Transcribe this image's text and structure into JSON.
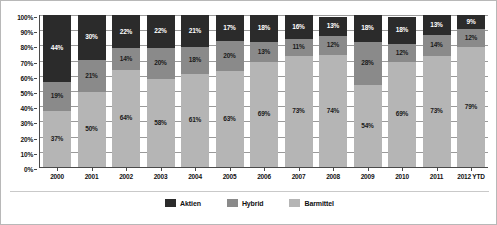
{
  "chart_data": {
    "type": "bar",
    "variant": "stacked-100-percent",
    "title": "",
    "xlabel": "",
    "ylabel": "",
    "ylim": [
      0,
      100
    ],
    "ytick_labels": [
      "100%",
      "90%",
      "80%",
      "70%",
      "60%",
      "50%",
      "40%",
      "30%",
      "20%",
      "10%",
      "0%"
    ],
    "ytick_values": [
      100,
      90,
      80,
      70,
      60,
      50,
      40,
      30,
      20,
      10,
      0
    ],
    "grid": true,
    "legend_position": "bottom-center",
    "stack_order_bottom_to_top": [
      "Barmittel",
      "Hybrid",
      "Aktien"
    ],
    "categories": [
      "2000",
      "2001",
      "2002",
      "2003",
      "2004",
      "2005",
      "2006",
      "2007",
      "2008",
      "2009",
      "2010",
      "2011",
      "2012 YTD"
    ],
    "series": [
      {
        "name": "Aktien",
        "color": "#2b2b2b",
        "values": [
          44,
          30,
          22,
          22,
          21,
          17,
          18,
          16,
          13,
          18,
          18,
          13,
          9
        ],
        "labels": [
          "44%",
          "30%",
          "22%",
          "22%",
          "21%",
          "17%",
          "18%",
          "16%",
          "13%",
          "18%",
          "18%",
          "13%",
          "9%"
        ]
      },
      {
        "name": "Hybrid",
        "color": "#8a8a8a",
        "values": [
          19,
          21,
          14,
          20,
          18,
          20,
          13,
          11,
          12,
          28,
          12,
          14,
          12
        ],
        "labels": [
          "19%",
          "21%",
          "14%",
          "20%",
          "18%",
          "20%",
          "13%",
          "11%",
          "12%",
          "28%",
          "12%",
          "14%",
          "12%"
        ]
      },
      {
        "name": "Barmittel",
        "color": "#b5b5b5",
        "values": [
          37,
          50,
          64,
          58,
          61,
          63,
          69,
          73,
          74,
          54,
          69,
          73,
          79
        ],
        "labels": [
          "37%",
          "50%",
          "64%",
          "58%",
          "61%",
          "63%",
          "69%",
          "73%",
          "74%",
          "54%",
          "69%",
          "73%",
          "79%"
        ]
      }
    ]
  },
  "legend": {
    "items": [
      {
        "label": "Aktien",
        "color": "#2b2b2b"
      },
      {
        "label": "Hybrid",
        "color": "#8a8a8a"
      },
      {
        "label": "Barmittel",
        "color": "#b5b5b5"
      }
    ]
  }
}
